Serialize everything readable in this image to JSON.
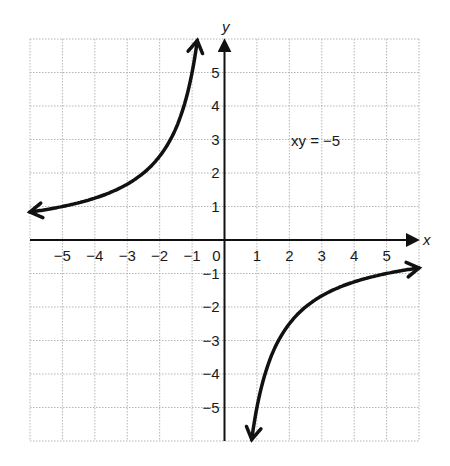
{
  "chart_data": {
    "type": "line",
    "title": "",
    "equation_label": "xy = −5",
    "function": "y = -5/x",
    "xlabel": "x",
    "ylabel": "y",
    "xlim": [
      -6,
      6
    ],
    "ylim": [
      -6,
      6
    ],
    "grid": true,
    "grid_style": "dotted",
    "x_ticks": [
      "−5",
      "−4",
      "−3",
      "−2",
      "−1",
      "0",
      "1",
      "2",
      "3",
      "4",
      "5"
    ],
    "x_tick_values": [
      -5,
      -4,
      -3,
      -2,
      -1,
      0,
      1,
      2,
      3,
      4,
      5
    ],
    "y_ticks": [
      "5",
      "4",
      "3",
      "2",
      "1",
      "−1",
      "−2",
      "−3",
      "−4",
      "−5"
    ],
    "y_tick_values": [
      5,
      4,
      3,
      2,
      1,
      -1,
      -2,
      -3,
      -4,
      -5
    ],
    "series": [
      {
        "name": "branch-quadrant-II",
        "x": [
          -6,
          -5,
          -4,
          -3,
          -2.5,
          -2,
          -1.5,
          -1.25,
          -1,
          -0.9,
          -0.83
        ],
        "values": [
          0.83,
          1,
          1.25,
          1.67,
          2,
          2.5,
          3.33,
          4,
          5,
          5.56,
          6
        ],
        "arrows": "both"
      },
      {
        "name": "branch-quadrant-IV",
        "x": [
          0.83,
          0.9,
          1,
          1.25,
          1.5,
          2,
          2.5,
          3,
          4,
          5,
          6
        ],
        "values": [
          -6,
          -5.56,
          -5,
          -4,
          -3.33,
          -2.5,
          -2,
          -1.67,
          -1.25,
          -1,
          -0.83
        ],
        "arrows": "both"
      }
    ],
    "colors": {
      "curve": "#111111",
      "axis": "#111111",
      "grid": "#b5b5b5"
    }
  }
}
